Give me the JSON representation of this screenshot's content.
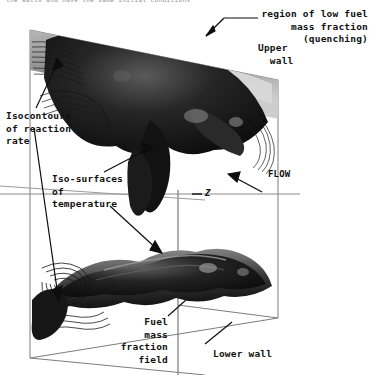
{
  "figure": {
    "caption_fragment": "the walls and have the same initial conditions",
    "annotations": {
      "quenching": "region of low fuel\nmass fraction\n(quenching)",
      "upper_wall": "Upper\n  wall",
      "isocontours": "Isocontours\nof reaction\nrate",
      "isosurfaces": "Iso-surfaces\nof\ntemperature",
      "flow": "FLOW",
      "axis_z": "Z",
      "fuel_field": "Fuel\nmass\nfraction\nfield",
      "lower_wall": "Lower wall"
    },
    "colors": {
      "background": "#ffffff",
      "ink": "#111111",
      "wireframe": "#7a7a7a",
      "surface_dark": "#101010",
      "surface_mid": "#4a4a4a",
      "surface_light": "#cfcfcf"
    }
  }
}
